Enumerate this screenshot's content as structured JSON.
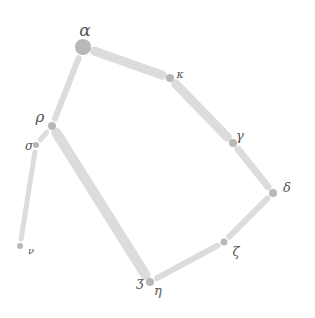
{
  "diagram": {
    "type": "graph",
    "style": "hand-drawn",
    "colors": {
      "edge": "#dcdcdc",
      "node": "#b8b8b8",
      "label": "#555555",
      "background": "#ffffff"
    },
    "nodes": [
      {
        "id": "alpha",
        "label": "α",
        "x": 83,
        "y": 47,
        "r": 8,
        "lx": 85,
        "ly": 36,
        "ls": 17
      },
      {
        "id": "kappa",
        "label": "κ",
        "x": 170,
        "y": 78,
        "r": 4,
        "lx": 180,
        "ly": 78,
        "ls": 11
      },
      {
        "id": "gamma",
        "label": "γ",
        "x": 233,
        "y": 143,
        "r": 4,
        "lx": 240,
        "ly": 140,
        "ls": 13
      },
      {
        "id": "delta",
        "label": "δ",
        "x": 273,
        "y": 193,
        "r": 4,
        "lx": 287,
        "ly": 192,
        "ls": 13
      },
      {
        "id": "zeta",
        "label": "ζ",
        "x": 224,
        "y": 242,
        "r": 3.5,
        "lx": 236,
        "ly": 256,
        "ls": 13
      },
      {
        "id": "eta",
        "label": "η",
        "x": 150,
        "y": 282,
        "r": 4,
        "lx": 158,
        "ly": 295,
        "ls": 13
      },
      {
        "id": "ezh",
        "label": "ʒ",
        "x": 150,
        "y": 282,
        "r": 0,
        "lx": 140,
        "ly": 286,
        "ls": 13
      },
      {
        "id": "rho",
        "label": "ρ",
        "x": 52,
        "y": 126,
        "r": 4,
        "lx": 40,
        "ly": 122,
        "ls": 15
      },
      {
        "id": "sigma",
        "label": "σ",
        "x": 36,
        "y": 145,
        "r": 3,
        "lx": 29,
        "ly": 150,
        "ls": 12
      },
      {
        "id": "nu",
        "label": "ν",
        "x": 20,
        "y": 246,
        "r": 3,
        "lx": 31,
        "ly": 254,
        "ls": 10
      }
    ],
    "edges": [
      {
        "from": "alpha",
        "to": "kappa",
        "w": 9
      },
      {
        "from": "kappa",
        "to": "gamma",
        "w": 9
      },
      {
        "from": "gamma",
        "to": "delta",
        "w": 7
      },
      {
        "from": "delta",
        "to": "zeta",
        "w": 6
      },
      {
        "from": "zeta",
        "to": "eta",
        "w": 6
      },
      {
        "from": "eta",
        "to": "rho",
        "w": 10
      },
      {
        "from": "rho",
        "to": "alpha",
        "w": 6
      },
      {
        "from": "rho",
        "to": "sigma",
        "w": 5
      },
      {
        "from": "sigma",
        "to": "nu",
        "w": 5
      }
    ]
  }
}
